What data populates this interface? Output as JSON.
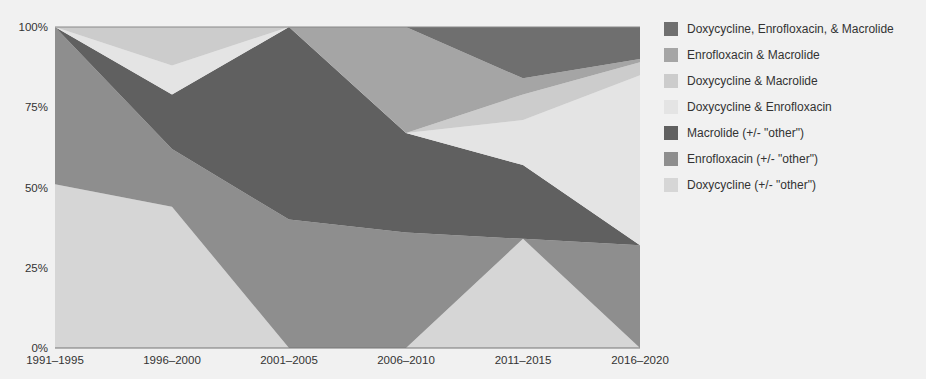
{
  "chart_data": {
    "type": "area",
    "stacked": true,
    "normalized": true,
    "title": "",
    "xlabel": "",
    "ylabel": "",
    "ylim": [
      0,
      100
    ],
    "categories": [
      "1991–1995",
      "1996–2000",
      "2001–2005",
      "2006–2010",
      "2011–2015",
      "2016–2020"
    ],
    "yticks": [
      "0%",
      "25%",
      "50%",
      "75%",
      "100%"
    ],
    "legend_position": "right",
    "grid": false,
    "series": [
      {
        "name": "Doxycycline (+/- \"other\")",
        "color": "#d6d6d6",
        "values": [
          51,
          44,
          0,
          0,
          34,
          0
        ]
      },
      {
        "name": "Enrofloxacin (+/- \"other\")",
        "color": "#8e8e8e",
        "values": [
          49,
          18,
          40,
          36,
          0,
          32
        ]
      },
      {
        "name": "Macrolide (+/- \"other\")",
        "color": "#606060",
        "values": [
          0,
          17,
          60,
          31,
          23,
          0
        ]
      },
      {
        "name": "Doxycycline & Enrofloxacin",
        "color": "#e4e4e4",
        "values": [
          0,
          9,
          0,
          0,
          14,
          53
        ]
      },
      {
        "name": "Doxycycline & Macrolide",
        "color": "#cccccc",
        "values": [
          0,
          12,
          0,
          0,
          8,
          4
        ]
      },
      {
        "name": "Enrofloxacin & Macrolide",
        "color": "#a5a5a5",
        "values": [
          0,
          0,
          0,
          33,
          5,
          1
        ]
      },
      {
        "name": "Doxycycline, Enrofloxacin, & Macrolide",
        "color": "#6f6f6f",
        "values": [
          0,
          0,
          0,
          0,
          16,
          10
        ]
      }
    ]
  },
  "legend": {
    "items": [
      {
        "label": "Doxycycline, Enrofloxacin, & Macrolide",
        "color": "#6f6f6f"
      },
      {
        "label": "Enrofloxacin & Macrolide",
        "color": "#a5a5a5"
      },
      {
        "label": "Doxycycline & Macrolide",
        "color": "#cccccc"
      },
      {
        "label": "Doxycycline & Enrofloxacin",
        "color": "#e4e4e4"
      },
      {
        "label": "Macrolide (+/- \"other\")",
        "color": "#606060"
      },
      {
        "label": "Enrofloxacin (+/- \"other\")",
        "color": "#8e8e8e"
      },
      {
        "label": "Doxycycline (+/- \"other\")",
        "color": "#d6d6d6"
      }
    ]
  }
}
